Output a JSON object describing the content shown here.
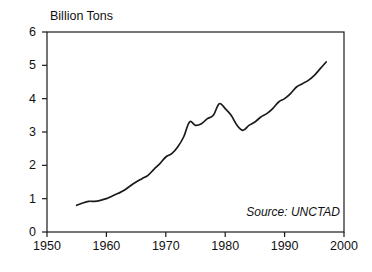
{
  "chart_data": {
    "type": "line",
    "title": "",
    "ylabel": "Billion Tons",
    "xlabel": "",
    "xlim": [
      1950,
      2000
    ],
    "ylim": [
      0,
      6
    ],
    "grid": false,
    "legend": null,
    "annotations": [
      {
        "name": "source",
        "text": "Source: UNCTAD",
        "position": "bottom-right-inside",
        "style": "italic"
      }
    ],
    "y_ticks": [
      0,
      1,
      2,
      3,
      4,
      5,
      6
    ],
    "y_tick_labels": [
      "0",
      "1",
      "2",
      "3",
      "4",
      "5",
      "6"
    ],
    "x_ticks": [
      1950,
      1960,
      1970,
      1980,
      1990,
      2000
    ],
    "x_tick_labels": [
      "1950",
      "1960",
      "1970",
      "1980",
      "1990",
      "2000"
    ],
    "series": [
      {
        "name": "World seaborne trade",
        "color": "#1a1a1a",
        "x": [
          1955,
          1956,
          1957,
          1958,
          1959,
          1960,
          1961,
          1962,
          1963,
          1964,
          1965,
          1966,
          1967,
          1968,
          1969,
          1970,
          1971,
          1972,
          1973,
          1974,
          1975,
          1976,
          1977,
          1978,
          1979,
          1980,
          1981,
          1982,
          1983,
          1984,
          1985,
          1986,
          1987,
          1988,
          1989,
          1990,
          1991,
          1992,
          1993,
          1994,
          1995,
          1996,
          1997
        ],
        "values": [
          0.8,
          0.87,
          0.92,
          0.92,
          0.95,
          1.0,
          1.08,
          1.16,
          1.25,
          1.38,
          1.5,
          1.6,
          1.7,
          1.88,
          2.05,
          2.25,
          2.35,
          2.55,
          2.85,
          3.3,
          3.2,
          3.25,
          3.4,
          3.5,
          3.85,
          3.7,
          3.5,
          3.2,
          3.05,
          3.2,
          3.3,
          3.45,
          3.55,
          3.7,
          3.9,
          4.0,
          4.15,
          4.35,
          4.45,
          4.55,
          4.7,
          4.9,
          5.1
        ]
      }
    ]
  },
  "axes": {
    "geometry": {
      "left_px": 47,
      "right_px": 344,
      "top_px": 32,
      "bottom_px": 232
    }
  }
}
